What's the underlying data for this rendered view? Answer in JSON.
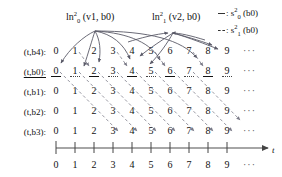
{
  "figure": {
    "title_left": {
      "name": "ln",
      "sup": "2",
      "sub": "0",
      "args": "(v1, b0)"
    },
    "title_right": {
      "name": "ln",
      "sup": "2",
      "sub": "1",
      "args": "(v2, b0)"
    }
  },
  "legend": {
    "items": [
      {
        "dash_style": "solid",
        "sep": ":",
        "name": "s",
        "sup": "2",
        "sub": "0",
        "args": "(b0)"
      },
      {
        "dash_style": "dashed",
        "sep": ":",
        "name": "s",
        "sup": "2",
        "sub": "1",
        "args": "(b0)"
      }
    ]
  },
  "rows": [
    {
      "label": "(t,b4):",
      "underlined": false,
      "digits": [
        "0",
        "1",
        "2",
        "3",
        "4",
        "5",
        "6",
        "7",
        "8",
        "9"
      ],
      "ellipsis": "···",
      "digit_underline": "none"
    },
    {
      "label": "(t,b0):",
      "underlined": true,
      "digits": [
        "0",
        "1",
        "2",
        "3",
        "4",
        "5",
        "6",
        "7",
        "8",
        "9"
      ],
      "ellipsis": "···",
      "digit_underline": "alternating"
    },
    {
      "label": "(t,b1):",
      "underlined": false,
      "digits": [
        "0",
        "1",
        "2",
        "3",
        "4",
        "5",
        "6",
        "7",
        "8",
        "9"
      ],
      "ellipsis": "···",
      "digit_underline": "none"
    },
    {
      "label": "(t,b2):",
      "underlined": false,
      "digits": [
        "0",
        "1",
        "2",
        "3",
        "4",
        "5",
        "6",
        "7",
        "8",
        "9"
      ],
      "ellipsis": "···",
      "digit_underline": "none"
    },
    {
      "label": "(t,b3):",
      "underlined": false,
      "digits": [
        "0",
        "1",
        "2",
        "3",
        "4",
        "5",
        "6",
        "7",
        "8",
        "9"
      ],
      "ellipsis": "···",
      "digit_underline": "none"
    }
  ],
  "axis": {
    "label": "t",
    "ticks": [
      "0",
      "1",
      "2",
      "3",
      "4",
      "5",
      "6",
      "7",
      "8",
      "9"
    ],
    "ellipsis": "···"
  },
  "colors": {
    "ink": "#111111",
    "arrow": "#5a5a68",
    "axis": "#444444"
  }
}
